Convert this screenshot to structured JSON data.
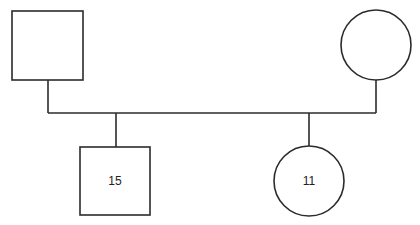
{
  "diagram": {
    "type": "pedigree",
    "parents": [
      {
        "id": "father",
        "sex": "male",
        "shape": "square",
        "label": ""
      },
      {
        "id": "mother",
        "sex": "female",
        "shape": "circle",
        "label": ""
      }
    ],
    "children": [
      {
        "id": "son",
        "sex": "male",
        "shape": "square",
        "label": "15"
      },
      {
        "id": "daughter",
        "sex": "female",
        "shape": "circle",
        "label": "11"
      }
    ],
    "colors": {
      "stroke": "#2b2b2b",
      "fill": "#ffffff",
      "text": "#222222"
    }
  }
}
